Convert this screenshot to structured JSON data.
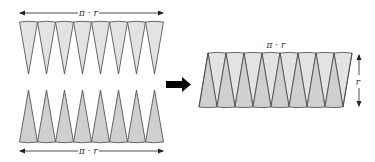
{
  "diagram": {
    "top_row": {
      "label": "π · r",
      "sector_count": 8,
      "orientation": "down"
    },
    "bottom_row": {
      "label": "π · r",
      "sector_count": 8,
      "orientation": "up"
    },
    "transform_arrow": {
      "icon": "right-arrow-icon"
    },
    "result": {
      "width_label": "π · r",
      "height_label": "r",
      "sector_count": 16
    },
    "colors": {
      "light_fill": "#e3e3e3",
      "dark_fill": "#cfcfcf",
      "stroke": "#444444",
      "arrow": "#000000"
    }
  }
}
